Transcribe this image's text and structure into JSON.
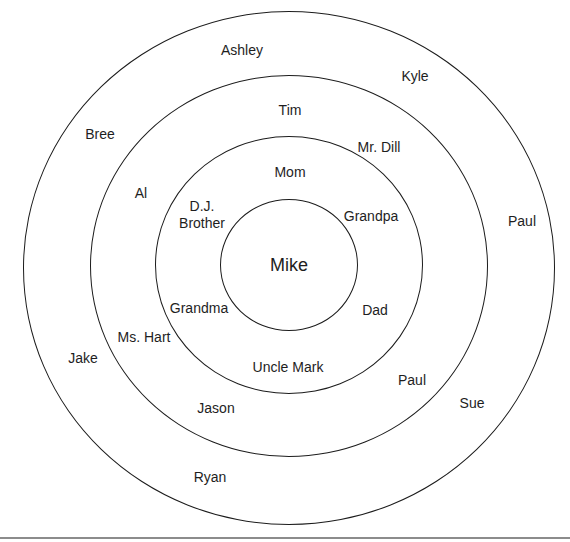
{
  "diagram": {
    "type": "concentric-circles",
    "title": "",
    "center": {
      "name": "Mike"
    },
    "rings": [
      {
        "level": 1,
        "geometry": {
          "cx": 289,
          "cy": 265,
          "rx": 69,
          "ry": 66
        },
        "members": []
      },
      {
        "level": 2,
        "geometry": {
          "cx": 289,
          "cy": 265,
          "rx": 134,
          "ry": 129
        },
        "members": [
          {
            "name": "Mom",
            "x": 290,
            "y": 172
          },
          {
            "name": "Grandpa",
            "x": 371,
            "y": 216
          },
          {
            "name": "Dad",
            "x": 375,
            "y": 310
          },
          {
            "name": "Uncle Mark",
            "x": 288,
            "y": 367
          },
          {
            "name": "Grandma",
            "x": 199,
            "y": 308
          },
          {
            "name": "D.J. Brother",
            "lines": [
              "D.J.",
              "Brother"
            ],
            "x": 202,
            "y": 215
          }
        ]
      },
      {
        "level": 3,
        "geometry": {
          "cx": 289,
          "cy": 266,
          "rx": 199,
          "ry": 191
        },
        "members": [
          {
            "name": "Tim",
            "x": 290,
            "y": 110
          },
          {
            "name": "Mr. Dill",
            "x": 379,
            "y": 147
          },
          {
            "name": "Paul",
            "x": 412,
            "y": 380
          },
          {
            "name": "Jason",
            "x": 216,
            "y": 408
          },
          {
            "name": "Ms. Hart",
            "x": 144,
            "y": 337
          },
          {
            "name": "Al",
            "x": 141,
            "y": 193
          }
        ]
      },
      {
        "level": 4,
        "geometry": {
          "cx": 289,
          "cy": 268,
          "rx": 266,
          "ry": 257
        },
        "members": [
          {
            "name": "Ashley",
            "x": 242,
            "y": 50
          },
          {
            "name": "Kyle",
            "x": 415,
            "y": 76
          },
          {
            "name": "Paul",
            "x": 522,
            "y": 221
          },
          {
            "name": "Sue",
            "x": 472,
            "y": 403
          },
          {
            "name": "Ryan",
            "x": 210,
            "y": 477
          },
          {
            "name": "Jake",
            "x": 83,
            "y": 358
          },
          {
            "name": "Bree",
            "x": 100,
            "y": 134
          }
        ]
      }
    ],
    "colors": {
      "background": "#ffffff",
      "stroke": "#1c1c1c",
      "text": "#1e1e1e",
      "rule": "#8c8c8c"
    }
  }
}
